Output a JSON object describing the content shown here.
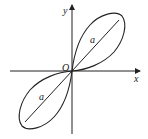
{
  "diagram": {
    "type": "lemniscate",
    "axes": {
      "x_label": "x",
      "y_label": "y",
      "origin_label": "O"
    },
    "lobes": [
      {
        "position": "upper-right",
        "length_label": "a"
      },
      {
        "position": "lower-left",
        "length_label": "a"
      }
    ],
    "colors": {
      "stroke": "#222222",
      "background": "#ffffff"
    }
  }
}
